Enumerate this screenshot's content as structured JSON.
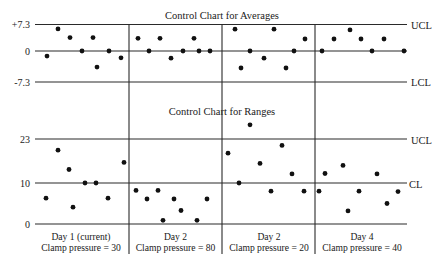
{
  "chart_data": [
    {
      "type": "scatter",
      "title": "Control Chart for Averages",
      "xlabel": "",
      "ylabel": "",
      "y_ticks": [
        "+7.3",
        "0",
        "-7.3"
      ],
      "limits": {
        "UCL": 7.3,
        "center": 0,
        "LCL": -7.3
      },
      "limit_labels": {
        "upper": "UCL",
        "lower": "LCL"
      },
      "ylim": [
        -7.3,
        7.3
      ],
      "grid": false,
      "groups": [
        {
          "label": "Day 1 (current)",
          "condition": "Clamp pressure = 30",
          "x": [
            47,
            58,
            70,
            82,
            93,
            97,
            109,
            121
          ],
          "values": [
            -1.2,
            6.1,
            3.7,
            0,
            3.7,
            -3.8,
            0,
            -1.6
          ]
        },
        {
          "label": "Day 2",
          "condition": "Clamp pressure = 80",
          "x": [
            138,
            149,
            160,
            171,
            183,
            194,
            199,
            210
          ],
          "values": [
            3.5,
            0,
            3.5,
            -1.7,
            0,
            3.5,
            0,
            0
          ]
        },
        {
          "label": "Day 2",
          "condition": "Clamp pressure = 20",
          "x": [
            235,
            241,
            250,
            264,
            274,
            286,
            294,
            305
          ],
          "values": [
            6.0,
            -4.0,
            0,
            -1.7,
            6.0,
            -4.0,
            0,
            3.3
          ]
        },
        {
          "label": "Day 4",
          "condition": "Clamp pressure = 40",
          "x": [
            322,
            334,
            350,
            361,
            372,
            384,
            404
          ],
          "values": [
            0,
            3.3,
            5.8,
            3.3,
            0,
            3.3,
            0
          ]
        }
      ]
    },
    {
      "type": "scatter",
      "title": "Control Chart for Ranges",
      "xlabel": "",
      "ylabel": "",
      "y_ticks": [
        "23",
        "10",
        "0"
      ],
      "limits": {
        "UCL": 23,
        "CL": 10,
        "zero": 0
      },
      "limit_labels": {
        "upper": "UCL",
        "center": "CL"
      },
      "ylim": [
        0,
        23
      ],
      "grid": false,
      "groups": [
        {
          "label": "Day 1 (current)",
          "condition": "Clamp pressure = 30",
          "x": [
            46,
            58,
            69,
            73,
            85,
            96,
            108,
            124
          ],
          "values": [
            6.3,
            19.7,
            14.0,
            4.1,
            10,
            10,
            6.3,
            16.1
          ]
        },
        {
          "label": "Day 2",
          "condition": "Clamp pressure = 80",
          "x": [
            136,
            147,
            158,
            163,
            174,
            181,
            197,
            207
          ],
          "values": [
            8.2,
            6.1,
            8.2,
            0.9,
            6.1,
            3.3,
            0.9,
            6.1
          ]
        },
        {
          "label": "Day 2",
          "condition": "Clamp pressure = 20",
          "x": [
            228,
            239,
            250,
            260,
            271,
            282,
            292,
            304
          ],
          "values": [
            18.8,
            10,
            27.2,
            15.8,
            8.0,
            21.1,
            12.7,
            8.0
          ]
        },
        {
          "label": "Day 4",
          "condition": "Clamp pressure = 40",
          "x": [
            319,
            325,
            343,
            348,
            359,
            377,
            387,
            398
          ],
          "values": [
            8.0,
            12.8,
            15.2,
            3.2,
            8.0,
            12.7,
            5.0,
            7.9
          ]
        }
      ]
    }
  ],
  "averages": {
    "title": "Control Chart for Averages",
    "tick_upper": "+7.3",
    "tick_center": "0",
    "tick_lower": "-7.3",
    "label_upper": "UCL",
    "label_lower": "LCL"
  },
  "ranges": {
    "title": "Control Chart for Ranges",
    "tick_upper": "23",
    "tick_center": "10",
    "tick_zero": "0",
    "label_upper": "UCL",
    "label_center": "CL"
  },
  "days": [
    {
      "label": "Day 1 (current)",
      "condition": "Clamp pressure = 30"
    },
    {
      "label": "Day 2",
      "condition": "Clamp pressure = 80"
    },
    {
      "label": "Day 2",
      "condition": "Clamp pressure = 20"
    },
    {
      "label": "Day 4",
      "condition": "Clamp pressure = 40"
    }
  ],
  "colors": {
    "line": "#2a2a2a",
    "point": "#111111",
    "background": "#ffffff"
  }
}
